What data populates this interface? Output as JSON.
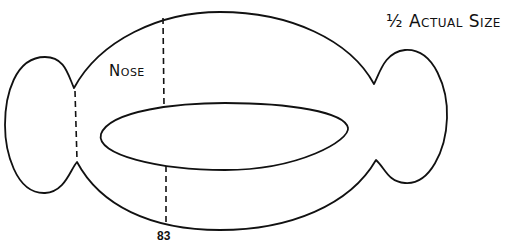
{
  "diagram": {
    "title": "½ Actual Size",
    "labels": {
      "nose": "Nose",
      "measurement": "83"
    },
    "shapes": {
      "outer_body": "oval body with pinched notches on left and right",
      "left_lobe": "rounded lobe on left end",
      "right_lobe": "rounded lobe on right end",
      "inner_opening": "elongated inner ellipse"
    },
    "dashed_lines": [
      {
        "name": "nose-guide-upper",
        "description": "vertical dashed line from top edge to inner ellipse"
      },
      {
        "name": "nose-guide-lower",
        "description": "vertical dashed line from inner ellipse to bottom edge, labeled 83"
      },
      {
        "name": "left-fold-line",
        "description": "vertical dashed line across left notch"
      }
    ],
    "colors": {
      "stroke": "#111111",
      "background": "#ffffff"
    }
  }
}
